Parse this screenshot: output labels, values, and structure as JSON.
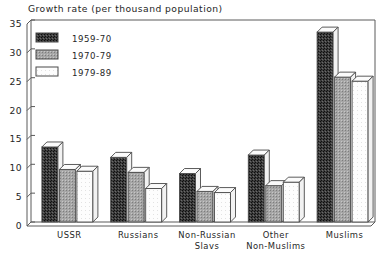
{
  "chart_data": {
    "type": "bar",
    "title": "Growth rate (per thousand population)",
    "xlabel": "",
    "ylabel": "",
    "ylim": [
      0,
      35
    ],
    "yticks": [
      0,
      5,
      10,
      15,
      20,
      25,
      30,
      35
    ],
    "grid": false,
    "legend_position": "top-left",
    "categories": [
      "USSR",
      "Russians",
      "Non-Russian Slavs",
      "Other Non-Muslims",
      "Muslims"
    ],
    "category_lines": [
      [
        "USSR"
      ],
      [
        "Russians"
      ],
      [
        "Non-Russian",
        "Slavs"
      ],
      [
        "Other",
        "Non-Muslims"
      ],
      [
        "Muslims"
      ]
    ],
    "series": [
      {
        "name": "1959-70",
        "values": [
          13.0,
          11.2,
          8.4,
          11.6,
          32.9
        ],
        "swatch": "dark-speckle"
      },
      {
        "name": "1970-79",
        "values": [
          9.1,
          8.6,
          5.3,
          6.3,
          25.1
        ],
        "swatch": "mid-gray"
      },
      {
        "name": "1979-89",
        "values": [
          8.8,
          5.8,
          5.1,
          6.9,
          24.4
        ],
        "swatch": "white"
      }
    ]
  },
  "colors": {
    "series_1959_70": "#3a3a3a",
    "series_1970_79": "#9a9a9a",
    "series_1979_89": "#ffffff",
    "axis": "#555555",
    "text": "#262626",
    "background": "#ffffff"
  },
  "legend": {
    "items": [
      {
        "label": "1959-70"
      },
      {
        "label": "1970-79"
      },
      {
        "label": "1979-89"
      }
    ]
  },
  "axis": {
    "y_tick_labels": [
      "35",
      "30",
      "25",
      "20",
      "15",
      "10",
      "5",
      "0"
    ]
  }
}
